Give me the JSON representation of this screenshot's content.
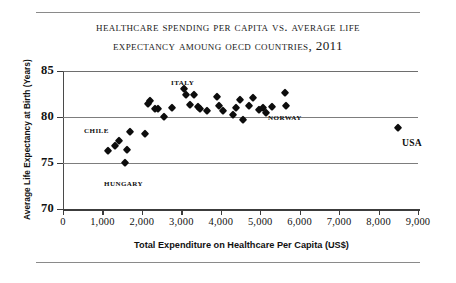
{
  "chart_data": {
    "type": "scatter",
    "title": "Healthcare Spending Per Capita vs. Average Life Expectancy Amoung OECD Countries, 2011",
    "title_line1": "Healthcare Spending Per Capita vs. Average Life",
    "title_line2": "Expectancy Amoung OECD Countries, 2011",
    "xlabel": "Total Expenditure on Healthcare Per Capita (US$)",
    "ylabel": "Average Life Expectancy at Birth (Years)",
    "xlim": [
      0,
      9000
    ],
    "ylim": [
      70,
      85
    ],
    "xticks": [
      0,
      1000,
      2000,
      3000,
      4000,
      5000,
      6000,
      7000,
      8000,
      9000
    ],
    "xtick_labels": [
      "0",
      "1,000",
      "2,000",
      "3,000",
      "4,000",
      "5,000",
      "6,000",
      "7,000",
      "8,000",
      "9,000"
    ],
    "yticks": [
      70,
      75,
      80,
      85
    ],
    "ytick_labels": [
      "70",
      "75",
      "80",
      "85"
    ],
    "grid": "horizontal",
    "legend": "none",
    "marker": "diamond",
    "marker_color": "#0d0d0d",
    "series": [
      {
        "name": "OECD Countries",
        "points": [
          {
            "x": 1150,
            "y": 76.3
          },
          {
            "x": 1320,
            "y": 76.9
          },
          {
            "x": 1430,
            "y": 77.4
          },
          {
            "x": 1560,
            "y": 75.0
          },
          {
            "x": 1620,
            "y": 76.4
          },
          {
            "x": 1700,
            "y": 78.4
          },
          {
            "x": 2080,
            "y": 78.1
          },
          {
            "x": 2150,
            "y": 81.4
          },
          {
            "x": 2210,
            "y": 81.7
          },
          {
            "x": 2330,
            "y": 80.9
          },
          {
            "x": 2400,
            "y": 80.9
          },
          {
            "x": 2560,
            "y": 80.0
          },
          {
            "x": 2760,
            "y": 81.0
          },
          {
            "x": 3060,
            "y": 83.0
          },
          {
            "x": 3120,
            "y": 82.4
          },
          {
            "x": 3210,
            "y": 81.3
          },
          {
            "x": 3330,
            "y": 82.4
          },
          {
            "x": 3420,
            "y": 81.1
          },
          {
            "x": 3470,
            "y": 80.9
          },
          {
            "x": 3650,
            "y": 80.7
          },
          {
            "x": 3900,
            "y": 82.2
          },
          {
            "x": 3960,
            "y": 81.2
          },
          {
            "x": 4050,
            "y": 80.6
          },
          {
            "x": 4300,
            "y": 80.2
          },
          {
            "x": 4380,
            "y": 81.0
          },
          {
            "x": 4480,
            "y": 81.8
          },
          {
            "x": 4560,
            "y": 79.7
          },
          {
            "x": 4720,
            "y": 81.2
          },
          {
            "x": 4810,
            "y": 82.1
          },
          {
            "x": 4980,
            "y": 80.8
          },
          {
            "x": 5060,
            "y": 81.0
          },
          {
            "x": 5150,
            "y": 80.4
          },
          {
            "x": 5300,
            "y": 81.1
          },
          {
            "x": 5620,
            "y": 82.6
          },
          {
            "x": 5660,
            "y": 81.2
          },
          {
            "x": 8500,
            "y": 78.8
          }
        ]
      }
    ],
    "annotations": [
      {
        "label": "Italy",
        "x_px": 171,
        "y_px": 76
      },
      {
        "label": "Chile",
        "x_px": 84,
        "y_px": 124
      },
      {
        "label": "Hungary",
        "x_px": 104,
        "y_px": 177
      },
      {
        "label": "Norway",
        "x_px": 268,
        "y_px": 111
      },
      {
        "label": "USA",
        "x_px": 402,
        "y_px": 137,
        "style": "upper"
      }
    ]
  }
}
